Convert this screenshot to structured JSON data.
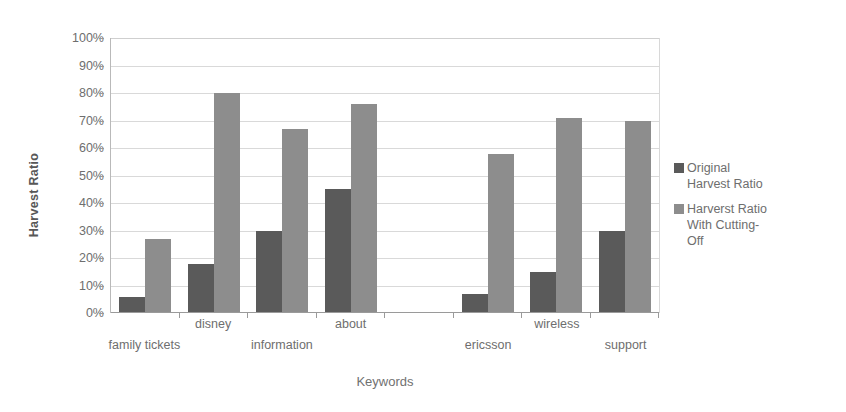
{
  "chart_data": {
    "type": "bar",
    "title": "",
    "xlabel": "Keywords",
    "ylabel": "Harvest Ratio",
    "categories": [
      "family tickets",
      "disney",
      "information",
      "about",
      "",
      "ericsson",
      "wireless",
      "support"
    ],
    "series": [
      {
        "name": "Original\nHarvest Ratio",
        "color": "#5a5a5a",
        "values": [
          6,
          18,
          30,
          45,
          0,
          7,
          15,
          30
        ]
      },
      {
        "name": "Harverst Ratio\nWith Cutting-\nOff",
        "color": "#8d8d8d",
        "values": [
          27,
          80,
          67,
          76,
          0,
          58,
          71,
          70
        ]
      }
    ],
    "ylim": [
      0,
      100
    ],
    "yticks": [
      "0%",
      "10%",
      "20%",
      "30%",
      "40%",
      "50%",
      "60%",
      "70%",
      "80%",
      "90%",
      "100%"
    ],
    "ytick_values": [
      0,
      10,
      20,
      30,
      40,
      50,
      60,
      70,
      80,
      90,
      100
    ],
    "grid": true,
    "legend_position": "right",
    "label_rows": [
      1,
      0,
      1,
      0,
      1,
      1,
      0,
      1
    ]
  },
  "legend": {
    "items": [
      {
        "label": "Original\nHarvest Ratio",
        "color": "#5a5a5a"
      },
      {
        "label": "Harverst Ratio\nWith Cutting-\nOff",
        "color": "#8d8d8d"
      }
    ]
  },
  "axes": {
    "y_title": "Harvest Ratio",
    "x_title": "Keywords"
  }
}
